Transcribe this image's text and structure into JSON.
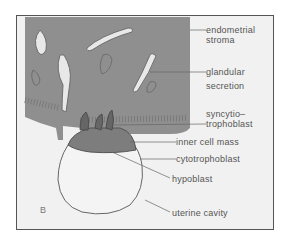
{
  "figure": {
    "panel_letter": "B",
    "labels": {
      "endometrial_stroma": [
        "endometrial",
        "stroma"
      ],
      "glandular_secretion": [
        "glandular",
        "secretion"
      ],
      "syncytiotrophoblast": [
        "syncytio–",
        "trophoblast"
      ],
      "inner_cell_mass": "inner cell mass",
      "cytotrophoblast": "cytotrophoblast",
      "hypoblast": "hypoblast",
      "uterine_cavity": "uterine cavity"
    },
    "colors": {
      "stroma": "#8f8f8f",
      "background": "#f1f1f1",
      "text": "#555555",
      "frame": "#555555"
    }
  }
}
